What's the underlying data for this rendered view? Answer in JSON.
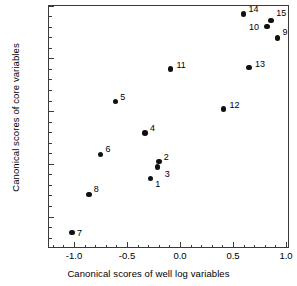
{
  "chart_data": {
    "type": "scatter",
    "title": "",
    "xlabel": "Canonical scores of well log variables",
    "ylabel": "Canonical scores of core variables",
    "xlim": [
      -1.18,
      1.09
    ],
    "ylim": [
      -1.23,
      1.05
    ],
    "xticks": [
      -1.0,
      -0.5,
      0.0,
      0.5,
      1.0
    ],
    "xticklabels": [
      "-1.0",
      "-0.5",
      "0.0",
      "0.5",
      "1.0"
    ],
    "yticks": [
      -1.0,
      -0.5,
      0.0,
      0.5,
      1.0
    ],
    "yticklabels": [
      "-1.0",
      "-0.5",
      "0.0",
      "0.5",
      "1.0"
    ],
    "grid": false,
    "legend": "none",
    "minor_ticks": true,
    "marker": "filled-circle",
    "marker_color": "#111111",
    "points": [
      {
        "label": "1",
        "x": -0.28,
        "y": -0.64,
        "label_dx": 5,
        "label_dy": 1
      },
      {
        "label": "2",
        "x": -0.2,
        "y": -0.48,
        "label_dx": 5,
        "label_dy": -9
      },
      {
        "label": "3",
        "x": -0.21,
        "y": -0.53,
        "label_dx": 7,
        "label_dy": 3
      },
      {
        "label": "4",
        "x": -0.33,
        "y": -0.21,
        "label_dx": 5,
        "label_dy": -9
      },
      {
        "label": "5",
        "x": -0.61,
        "y": 0.09,
        "label_dx": 5,
        "label_dy": -9
      },
      {
        "label": "6",
        "x": -0.75,
        "y": -0.41,
        "label_dx": 5,
        "label_dy": -9
      },
      {
        "label": "7",
        "x": -1.02,
        "y": -1.15,
        "label_dx": 5,
        "label_dy": -3
      },
      {
        "label": "8",
        "x": -0.86,
        "y": -0.79,
        "label_dx": 5,
        "label_dy": -9
      },
      {
        "label": "9",
        "x": 0.92,
        "y": 0.69,
        "label_dx": 5,
        "label_dy": -10
      },
      {
        "label": "10",
        "x": 0.82,
        "y": 0.8,
        "label_dx": -18,
        "label_dy": -4
      },
      {
        "label": "11",
        "x": -0.09,
        "y": 0.4,
        "label_dx": 6,
        "label_dy": -8
      },
      {
        "label": "12",
        "x": 0.41,
        "y": 0.02,
        "label_dx": 6,
        "label_dy": -8
      },
      {
        "label": "13",
        "x": 0.65,
        "y": 0.41,
        "label_dx": 6,
        "label_dy": -8
      },
      {
        "label": "14",
        "x": 0.6,
        "y": 0.92,
        "label_dx": 5,
        "label_dy": -9
      },
      {
        "label": "15",
        "x": 0.86,
        "y": 0.86,
        "label_dx": 5,
        "label_dy": -11
      }
    ]
  },
  "axes": {
    "x_title": "Canonical scores of well log variables",
    "y_title": "Canonical scores of core variables"
  }
}
